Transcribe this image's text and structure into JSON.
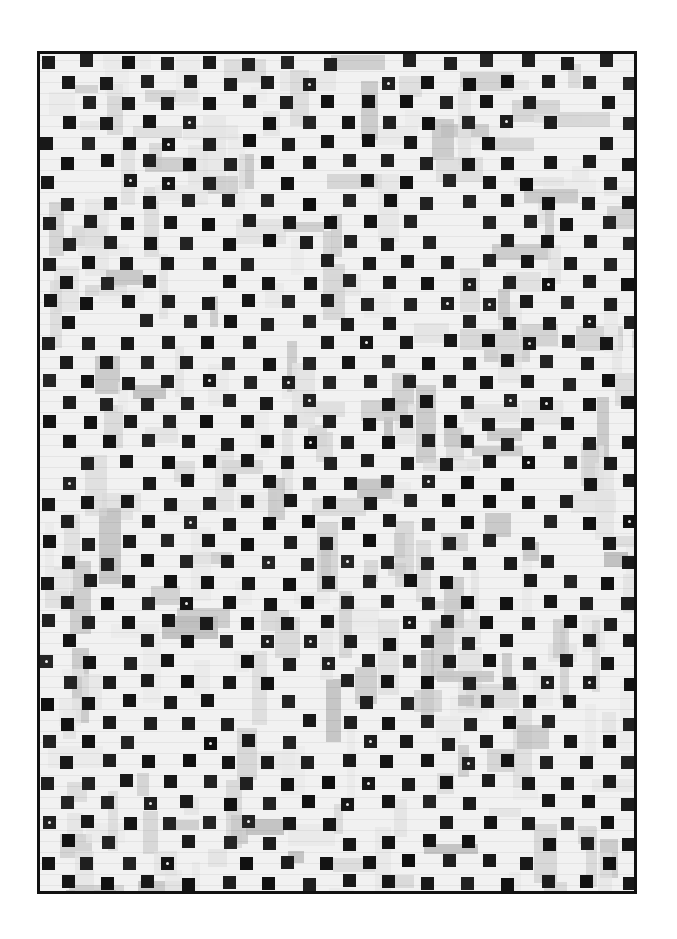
{
  "image": {
    "subject": "Black and white patchwork quilt",
    "description": "Quilt of low-volume white and light gray printed fabric strips with a scattered grid of small black squares, bound with black binding"
  },
  "colors": {
    "background": "#ffffff",
    "quilt_base": "#f1f1f1",
    "binding": "#111111",
    "accent_square": "#161616",
    "patch_tones": [
      "#e2e2e2",
      "#d6d6d6",
      "#c8c8c8",
      "#bdbdbd",
      "#e9e9e9"
    ]
  },
  "layout": {
    "quilt_frame": {
      "x": 37,
      "y": 51,
      "w": 600,
      "h": 843
    },
    "square_size": 13,
    "grid_pitch": 20,
    "columns": 30,
    "rows": 42
  }
}
